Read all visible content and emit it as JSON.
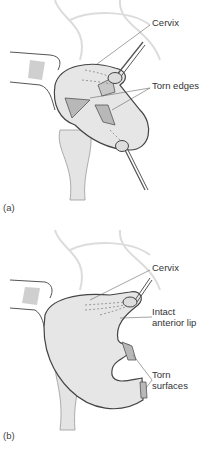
{
  "figure": {
    "panel_a": {
      "label": "(a)",
      "annotations": {
        "cervix": "Cervix",
        "torn_edges": "Torn edges"
      }
    },
    "panel_b": {
      "label": "(b)",
      "annotations": {
        "cervix": "Cervix",
        "intact_line1": "Intact",
        "intact_line2": "anterior lip",
        "torn_line1": "Torn",
        "torn_line2": "surfaces"
      }
    },
    "colors": {
      "tissue": "#e6e6e6",
      "tissue_dark": "#b8b8b8",
      "outline": "#444444",
      "bone": "#d8d8d8",
      "text": "#333333"
    }
  }
}
